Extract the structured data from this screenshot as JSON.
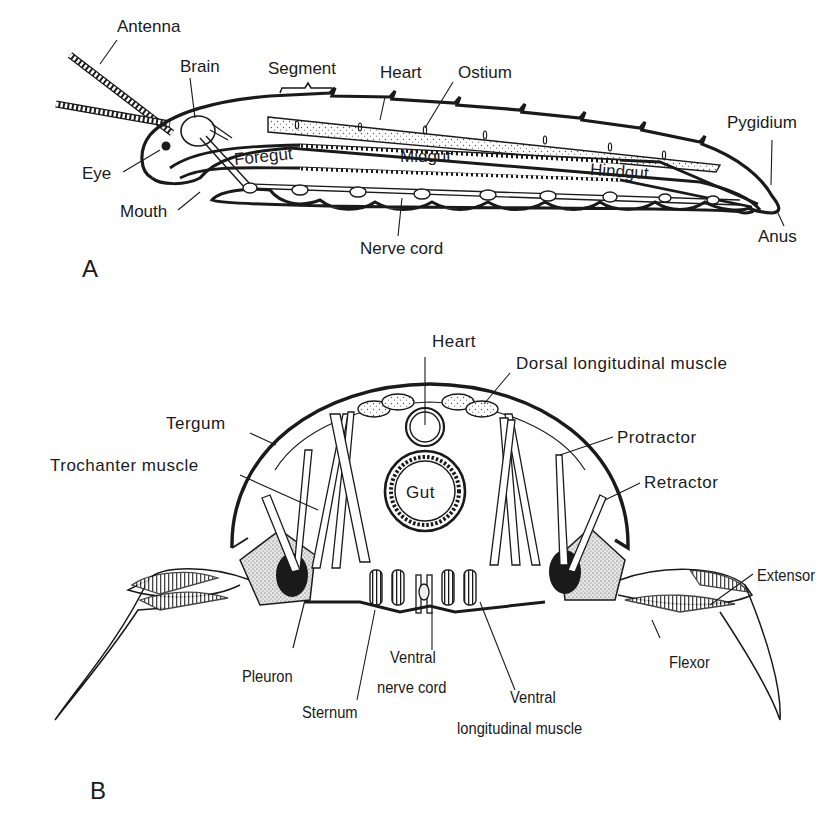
{
  "figure": {
    "panels": [
      {
        "id": "A",
        "letter": "A",
        "description": "Lateral view of generalized arthropod body",
        "labels": {
          "antenna": "Antenna",
          "brain": "Brain",
          "segment": "Segment",
          "heart": "Heart",
          "ostium": "Ostium",
          "pygidium": "Pygidium",
          "eye": "Eye",
          "foregut": "Foregut",
          "midgut": "Midgut",
          "hindgut": "Hindgut",
          "mouth": "Mouth",
          "nerve_cord": "Nerve cord",
          "anus": "Anus"
        }
      },
      {
        "id": "B",
        "letter": "B",
        "description": "Cross section of arthropod body segment with legs",
        "labels": {
          "heart": "Heart",
          "dorsal_longitudinal_muscle": "Dorsal longitudinal muscle",
          "tergum": "Tergum",
          "trochanter_muscle": "Trochanter muscle",
          "protractor": "Protractor",
          "retractor": "Retractor",
          "gut": "Gut",
          "extensor": "Extensor",
          "flexor": "Flexor",
          "pleuron": "Pleuron",
          "sternum": "Sternum",
          "ventral_nerve_cord_line1": "Ventral",
          "ventral_nerve_cord_line2": "nerve cord",
          "ventral_longitudinal_muscle_line1": "Ventral",
          "ventral_longitudinal_muscle_line2": "longitudinal muscle"
        }
      }
    ],
    "colors": {
      "ink": "#1a1a1a",
      "background": "#ffffff",
      "stipple": "#d9d9d9"
    }
  }
}
